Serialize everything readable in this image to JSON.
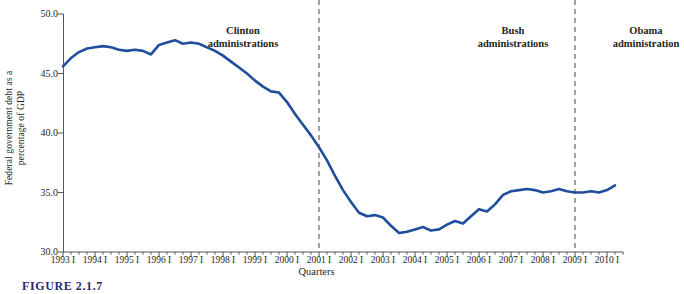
{
  "chart_data": {
    "type": "line",
    "title": "",
    "xlabel": "Quarters",
    "ylabel_line1": "Federal government debt as a",
    "ylabel_line2": "percentage of GDP",
    "ylim": [
      30.0,
      50.0
    ],
    "yticks": [
      30.0,
      35.0,
      40.0,
      45.0,
      50.0
    ],
    "ytick_labels": [
      "30.0",
      "35.0",
      "40.0",
      "45.0",
      "50.0"
    ],
    "grid": false,
    "legend": "none",
    "line_color": "#1f4e9c",
    "xlim": [
      1993.0,
      2010.5
    ],
    "xtick_labels": [
      "1993 I",
      "1994 I",
      "1995 I",
      "1996 I",
      "1997 I",
      "1998 I",
      "1999 I",
      "2000 I",
      "2001 I",
      "2002 I",
      "2003 I",
      "2004 I",
      "2005 I",
      "2006 I",
      "2007 I",
      "2008 I",
      "2009 I",
      "2010 I"
    ],
    "xtick_values": [
      1993,
      1994,
      1995,
      1996,
      1997,
      1998,
      1999,
      2000,
      2001,
      2002,
      2003,
      2004,
      2005,
      2006,
      2007,
      2008,
      2009,
      2010
    ],
    "minor_tick_interval_quarters": 1,
    "series": [
      {
        "name": "Federal government debt as a percentage of GDP",
        "color": "#1f4e9c",
        "x": [
          1993.0,
          1993.25,
          1993.5,
          1993.75,
          1994.0,
          1994.25,
          1994.5,
          1994.75,
          1995.0,
          1995.25,
          1995.5,
          1995.75,
          1996.0,
          1996.25,
          1996.5,
          1996.75,
          1997.0,
          1997.25,
          1997.5,
          1997.75,
          1998.0,
          1998.25,
          1998.5,
          1998.75,
          1999.0,
          1999.25,
          1999.5,
          1999.75,
          2000.0,
          2000.25,
          2000.5,
          2000.75,
          2001.0,
          2001.25,
          2001.5,
          2001.75,
          2002.0,
          2002.25,
          2002.5,
          2002.75,
          2003.0,
          2003.25,
          2003.5,
          2003.75,
          2004.0,
          2004.25,
          2004.5,
          2004.75,
          2005.0,
          2005.25,
          2005.5,
          2005.75,
          2006.0,
          2006.25,
          2006.5,
          2006.75,
          2007.0,
          2007.25,
          2007.5,
          2007.75,
          2008.0,
          2008.25,
          2008.5,
          2008.75,
          2009.0,
          2009.25,
          2009.5,
          2009.75,
          2010.0,
          2010.25
        ],
        "y": [
          45.6,
          46.3,
          46.8,
          47.1,
          47.2,
          47.3,
          47.2,
          47.0,
          46.9,
          47.0,
          46.9,
          46.6,
          47.4,
          47.6,
          47.8,
          47.5,
          47.6,
          47.5,
          47.2,
          46.9,
          46.5,
          46.0,
          45.5,
          45.0,
          44.4,
          43.9,
          43.5,
          43.4,
          42.6,
          41.6,
          40.7,
          39.8,
          38.8,
          37.7,
          36.4,
          35.2,
          34.2,
          33.3,
          33.0,
          33.1,
          32.9,
          32.2,
          31.6,
          31.7,
          31.9,
          32.1,
          31.8,
          31.9,
          32.3,
          32.6,
          32.4,
          33.0,
          33.6,
          33.4,
          34.0,
          34.8,
          35.1,
          35.2,
          35.3,
          35.2,
          35.0,
          35.1,
          35.3,
          35.1,
          35.0,
          35.0,
          35.1,
          35.0,
          35.2,
          35.6
        ]
      }
    ],
    "annotations": [
      {
        "id": "clinton",
        "line1": "Clinton",
        "line2": "administrations"
      },
      {
        "id": "bush",
        "line1": "Bush",
        "line2": "administrations"
      },
      {
        "id": "obama",
        "line1": "Obama",
        "line2": "administration"
      }
    ],
    "divider_lines": [
      {
        "id": "divider-2001",
        "x": 2001.0,
        "style": "dashed",
        "color": "#6e6e6e"
      },
      {
        "id": "divider-2009",
        "x": 2009.0,
        "style": "dashed",
        "color": "#6e6e6e"
      }
    ]
  },
  "caption": "FIGURE 2.1.7"
}
